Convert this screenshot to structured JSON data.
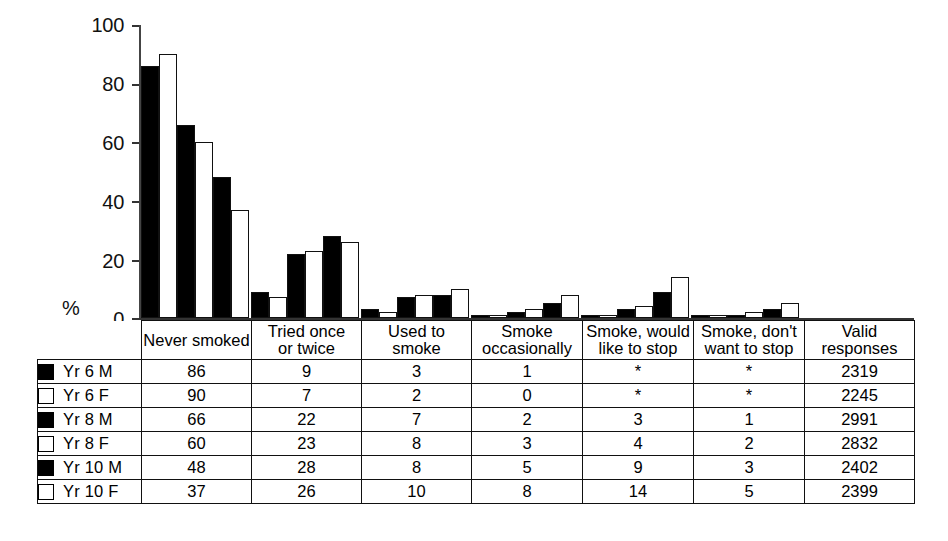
{
  "chart_data": {
    "type": "bar",
    "title": "",
    "xlabel": "",
    "ylabel": "%",
    "ylim": [
      0,
      100
    ],
    "yticks": [
      0,
      20,
      40,
      60,
      80,
      100
    ],
    "grid": false,
    "legend_position": "table-left-column",
    "categories": [
      "Never smoked",
      "Tried once or twice",
      "Used to smoke",
      "Smoke occasionally",
      "Smoke, would like to stop",
      "Smoke, don't want to stop"
    ],
    "series": [
      {
        "name": "Yr 6 M",
        "marker": "filled",
        "values": [
          86,
          9,
          3,
          1,
          0,
          0
        ],
        "display": [
          "86",
          "9",
          "3",
          "1",
          "*",
          "*"
        ]
      },
      {
        "name": "Yr 6 F",
        "marker": "open",
        "values": [
          90,
          7,
          2,
          0,
          0,
          0
        ],
        "display": [
          "90",
          "7",
          "2",
          "0",
          "*",
          "*"
        ]
      },
      {
        "name": "Yr 8 M",
        "marker": "filled",
        "values": [
          66,
          22,
          7,
          2,
          3,
          1
        ],
        "display": [
          "66",
          "22",
          "7",
          "2",
          "3",
          "1"
        ]
      },
      {
        "name": "Yr 8 F",
        "marker": "open",
        "values": [
          60,
          23,
          8,
          3,
          4,
          2
        ],
        "display": [
          "60",
          "23",
          "8",
          "3",
          "4",
          "2"
        ]
      },
      {
        "name": "Yr 10 M",
        "marker": "filled",
        "values": [
          48,
          28,
          8,
          5,
          9,
          3
        ],
        "display": [
          "48",
          "28",
          "8",
          "5",
          "9",
          "3"
        ]
      },
      {
        "name": "Yr 10 F",
        "marker": "open",
        "values": [
          37,
          26,
          10,
          8,
          14,
          5
        ],
        "display": [
          "37",
          "26",
          "10",
          "8",
          "14",
          "5"
        ]
      }
    ],
    "valid_responses": [
      "2319",
      "2245",
      "2991",
      "2832",
      "2402",
      "2399"
    ]
  },
  "axis": {
    "unit_label": "%",
    "tick_100": "100",
    "tick_80": "80",
    "tick_60": "60",
    "tick_40": "40",
    "tick_20": "20",
    "tick_0": "0"
  },
  "table": {
    "headers": {
      "legend": "",
      "c0_line1": "Never smoked",
      "c0_line2": "",
      "c1_line1": "Tried once",
      "c1_line2": "or twice",
      "c2_line1": "Used to smoke",
      "c2_line2": "",
      "c3_line1": "Smoke",
      "c3_line2": "occasionally",
      "c4_line1": "Smoke, would",
      "c4_line2": "like to stop",
      "c5_line1": "Smoke, don't",
      "c5_line2": "want to stop",
      "c6_line1": "Valid",
      "c6_line2": "responses"
    },
    "rows": [
      {
        "label": "Yr 6 M",
        "marker": "filled",
        "cells": [
          "86",
          "9",
          "3",
          "1",
          "*",
          "*",
          "2319"
        ]
      },
      {
        "label": "Yr 6 F",
        "marker": "open",
        "cells": [
          "90",
          "7",
          "2",
          "0",
          "*",
          "*",
          "2245"
        ]
      },
      {
        "label": "Yr 8 M",
        "marker": "filled",
        "cells": [
          "66",
          "22",
          "7",
          "2",
          "3",
          "1",
          "2991"
        ]
      },
      {
        "label": "Yr 8 F",
        "marker": "open",
        "cells": [
          "60",
          "23",
          "8",
          "3",
          "4",
          "2",
          "2832"
        ]
      },
      {
        "label": "Yr 10 M",
        "marker": "filled",
        "cells": [
          "48",
          "28",
          "8",
          "5",
          "9",
          "3",
          "2402"
        ]
      },
      {
        "label": "Yr 10 F",
        "marker": "open",
        "cells": [
          "37",
          "26",
          "10",
          "8",
          "14",
          "5",
          "2399"
        ]
      }
    ]
  }
}
